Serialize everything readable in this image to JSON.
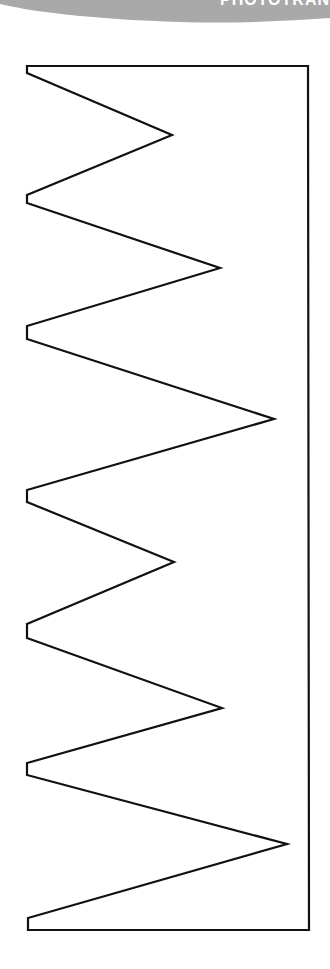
{
  "banner": {
    "text": "PHOTOTRAN",
    "color": "#a9a9a9",
    "text_color": "#ffffff"
  },
  "shape": {
    "description": "Zigzag outline template",
    "stroke": "#111111",
    "fill": "#ffffff",
    "stroke_width": 2.2,
    "points": [
      [
        27,
        66
      ],
      [
        308,
        66
      ],
      [
        309,
        930
      ],
      [
        28,
        930
      ],
      [
        28,
        918
      ],
      [
        287,
        844
      ],
      [
        27,
        775
      ],
      [
        27,
        763
      ],
      [
        222,
        708
      ],
      [
        27,
        638
      ],
      [
        27,
        624
      ],
      [
        174,
        562
      ],
      [
        27,
        502
      ],
      [
        27,
        490
      ],
      [
        274,
        419
      ],
      [
        27,
        339
      ],
      [
        27,
        326
      ],
      [
        220,
        268
      ],
      [
        27,
        203
      ],
      [
        27,
        195
      ],
      [
        172,
        135
      ],
      [
        27,
        73
      ]
    ]
  }
}
